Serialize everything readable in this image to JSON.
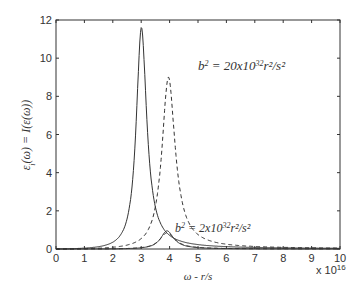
{
  "chart_data": {
    "type": "line",
    "title": "",
    "xlabel": "ω - r/s",
    "ylabel": "ε_i(ω) = I(ε(ω))",
    "x_multiplier": "x 10^16",
    "xlim": [
      0,
      10
    ],
    "ylim": [
      0,
      12
    ],
    "x_ticks": [
      0,
      1,
      2,
      3,
      4,
      5,
      6,
      7,
      8,
      9,
      10
    ],
    "y_ticks": [
      0,
      2,
      4,
      6,
      8,
      10,
      12
    ],
    "grid": false,
    "annotations": [
      {
        "text": "b² = 20x10³² r²/s²",
        "x": 4.9,
        "y": 9.6
      },
      {
        "text": "b² = 2x10³² r²/s²",
        "x": 4.9,
        "y": 0.9
      }
    ],
    "series": [
      {
        "name": "solid b²=20e32",
        "style": "solid",
        "peak_x": 3.0,
        "peak_y": 11.6,
        "width": 0.22
      },
      {
        "name": "dashed b²=20e32",
        "style": "dashed",
        "peak_x": 3.95,
        "peak_y": 9.0,
        "width": 0.28
      },
      {
        "name": "solid b²=2e32",
        "style": "solid",
        "peak_x": 3.9,
        "peak_y": 0.95,
        "width": 0.28
      },
      {
        "name": "dashed b²=2e32",
        "style": "dashed",
        "peak_x": 3.9,
        "peak_y": 0.85,
        "width": 0.32
      }
    ]
  },
  "labels": {
    "ylabel_main": "ε",
    "ylabel_sub": "i",
    "ylabel_rest": "(ω) = I(ε(ω))",
    "xlabel": "ω - r/s",
    "multiplier_base": "x 10",
    "multiplier_exp": "16",
    "ann1_b": "b",
    "ann1_rest": " = 20x10",
    "ann1_exp": "32",
    "ann1_tail": "r²/s²",
    "ann2_b": "b",
    "ann2_rest": " = 2x10",
    "ann2_exp": "32",
    "ann2_tail": "r²/s²"
  }
}
